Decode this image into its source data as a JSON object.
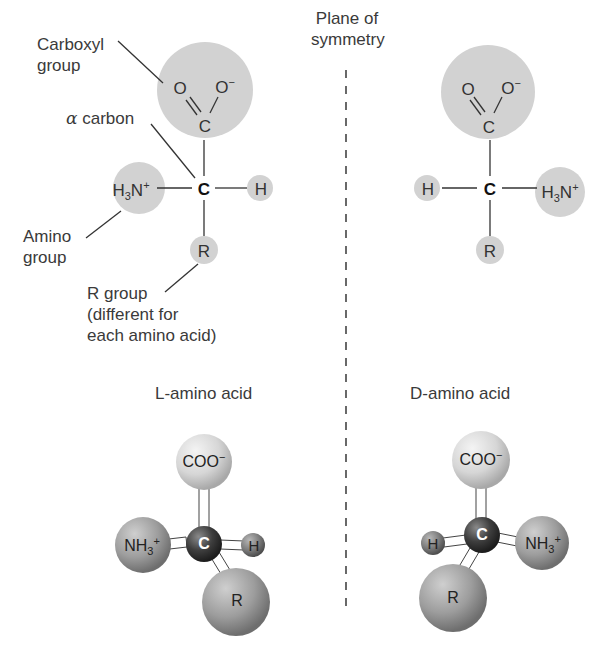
{
  "figure": {
    "plane_label_line1": "Plane of",
    "plane_label_line2": "symmetry",
    "left_structure": {
      "labels": {
        "carboxyl_line1": "Carboxyl",
        "carboxyl_line2": "group",
        "alpha_symbol": "α",
        "alpha_text": "carbon",
        "amino_line1": "Amino",
        "amino_line2": "group",
        "r_line1": "R group",
        "r_line2": "(different for",
        "r_line3": "each amino acid)"
      },
      "atoms": {
        "o_double": "O",
        "o_minus": "O",
        "o_minus_charge": "−",
        "carboxyl_c": "C",
        "alpha_c": "C",
        "amino_h": "H",
        "amino_sub": "3",
        "amino_n": "N",
        "amino_charge": "+",
        "h": "H",
        "r": "R"
      }
    },
    "right_structure": {
      "atoms": {
        "o_double": "O",
        "o_minus": "O",
        "o_minus_charge": "−",
        "carboxyl_c": "C",
        "alpha_c": "C",
        "amino_h": "H",
        "amino_sub": "3",
        "amino_n": "N",
        "amino_charge": "+",
        "h": "H",
        "r": "R"
      }
    },
    "l_model": {
      "title": "L-amino acid",
      "coo": "COO",
      "coo_charge": "−",
      "c": "C",
      "nh": "NH",
      "nh_sub": "3",
      "nh_charge": "+",
      "h": "H",
      "r": "R"
    },
    "d_model": {
      "title": "D-amino acid",
      "coo": "COO",
      "coo_charge": "−",
      "c": "C",
      "nh": "NH",
      "nh_sub": "3",
      "nh_charge": "+",
      "h": "H",
      "r": "R"
    },
    "colors": {
      "group_shade": "#d2d2d2",
      "text": "#3a3a3a",
      "carbon_ball": "#3a3a3a",
      "dashed_line": "#444444"
    }
  }
}
